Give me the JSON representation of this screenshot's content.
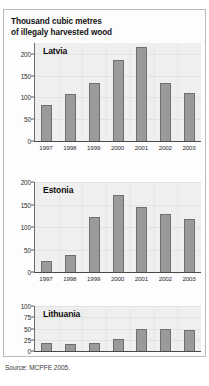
{
  "top_ghost_text": "",
  "title": {
    "line1": "Thousand cubic metres",
    "line2": "of illegaly harvested wood"
  },
  "source": "Source: MCPFE 2005.",
  "chart_data": [
    {
      "type": "bar",
      "title": "Latvia",
      "xlabel": "",
      "ylabel": "Thousand cubic metres of illegaly harvested wood",
      "categories": [
        "1997",
        "1998",
        "1999",
        "2000",
        "2001",
        "2002",
        "2003"
      ],
      "values": [
        82,
        108,
        134,
        187,
        215,
        134,
        111
      ],
      "ylim": [
        0,
        225
      ],
      "yticks": [
        0,
        50,
        100,
        150,
        200
      ],
      "ytick_labels": [
        "0",
        "50",
        "100",
        "150",
        "200"
      ],
      "grid": true,
      "legend": "none"
    },
    {
      "type": "bar",
      "title": "Estonia",
      "xlabel": "",
      "ylabel": "Thousand cubic metres of illegaly harvested wood",
      "categories": [
        "1997",
        "1998",
        "1999",
        "2000",
        "2001",
        "2002",
        "2003"
      ],
      "values": [
        25,
        37,
        122,
        172,
        145,
        129,
        117
      ],
      "ylim": [
        0,
        200
      ],
      "yticks": [
        0,
        50,
        100,
        150,
        200
      ],
      "ytick_labels": [
        "0",
        "50",
        "100",
        "150",
        "200"
      ],
      "grid": true,
      "legend": "none"
    },
    {
      "type": "bar",
      "title": "Lithuania",
      "xlabel": "",
      "ylabel": "Thousand cubic metres of illegaly harvested wood",
      "categories": [
        "1997",
        "1998",
        "1999",
        "2000",
        "2001",
        "2002",
        "2003"
      ],
      "values": [
        17,
        15,
        17,
        26,
        50,
        49,
        46
      ],
      "ylim": [
        0,
        100
      ],
      "yticks": [
        0,
        25,
        50,
        75,
        100
      ],
      "ytick_labels": [
        "0",
        "25",
        "50",
        "75",
        "100"
      ],
      "grid": true,
      "legend": "none"
    }
  ],
  "colors": {
    "bar_fill": "#9a9a9a",
    "bar_stroke": "#6f6f6f",
    "plot_background": "#efefef",
    "panel_border": "#b9b9b9",
    "axis": "#4a4a4a",
    "text": "#111111"
  },
  "layout": {
    "charts": [
      {
        "top": 33,
        "plot_height": 98,
        "xlabels_top": 133
      },
      {
        "top": 172,
        "plot_height": 90,
        "xlabels_top": 264
      },
      {
        "top": 296,
        "plot_height": 45,
        "xlabels_top": 343
      }
    ]
  }
}
